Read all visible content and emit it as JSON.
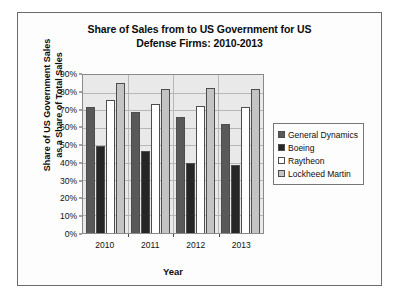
{
  "chart_data": {
    "type": "bar",
    "title": "Share of Sales from to US Government for US Defense Firms: 2010-2013",
    "title_line1": "Share of Sales from to US Government for US",
    "title_line2": "Defense Firms: 2010-2013",
    "xlabel": "Year",
    "ylabel": "Share of US Government Sales as a Share of Total Sales",
    "ylabel_line1": "Share of US Government Sales",
    "ylabel_line2": "as a Share of Total Sales",
    "categories": [
      "2010",
      "2011",
      "2012",
      "2013"
    ],
    "ylim": [
      0,
      90
    ],
    "ytick_values": [
      0,
      10,
      20,
      30,
      40,
      50,
      60,
      70,
      80,
      90
    ],
    "ytick_labels": [
      "0%",
      "10%",
      "20%",
      "30%",
      "40%",
      "50%",
      "60%",
      "70%",
      "80%",
      "90%"
    ],
    "grid": true,
    "legend_position": "right",
    "series": [
      {
        "name": "General Dynamics",
        "color": "#595959",
        "values": [
          72,
          69,
          66,
          62
        ]
      },
      {
        "name": "Boeing",
        "color": "#262626",
        "values": [
          49.5,
          46.5,
          40,
          38.5
        ]
      },
      {
        "name": "Raytheon",
        "color": "#ffffff",
        "values": [
          75.5,
          73.5,
          72.5,
          71.5
        ]
      },
      {
        "name": "Lockheed Martin",
        "color": "#c4c4c4",
        "values": [
          85.5,
          82,
          82.5,
          82
        ]
      }
    ]
  }
}
